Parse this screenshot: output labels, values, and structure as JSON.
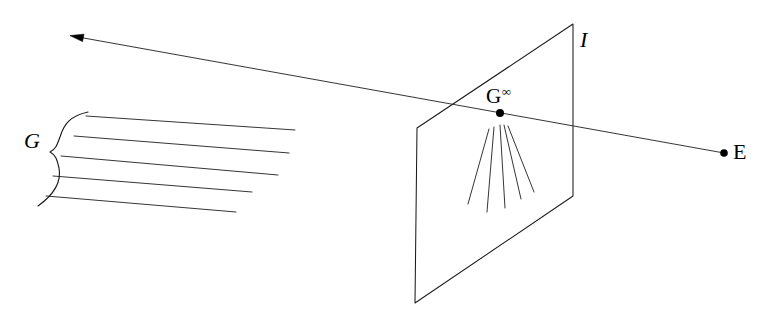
{
  "figure": {
    "background_color": "#ffffff",
    "ink_color": "#1b1b1b",
    "width": 783,
    "height": 322,
    "labels": {
      "pencil_of_lines": {
        "text": "G",
        "style": "italic",
        "x": 24,
        "y": 130,
        "description": "label for the family of parallel lines on the ground plane"
      },
      "image_plane": {
        "text": "I",
        "style": "italic",
        "x": 580,
        "y": 29,
        "description": "label for the image plane"
      },
      "eye_point": {
        "text": "E",
        "style": "roman",
        "x": 733,
        "y": 141,
        "description": "label for the eye / centre of projection"
      },
      "vanishing_point": {
        "base": "G",
        "superscript": "∞",
        "text": "G∞",
        "style": "roman",
        "x": 486,
        "y": 84,
        "description": "vanishing point, G superscript infinity"
      }
    },
    "points": [
      {
        "name": "vanishing-point",
        "label": "G∞",
        "x": 500,
        "y": 113,
        "radius": 4.0
      },
      {
        "name": "eye-point",
        "label": "E",
        "x": 724,
        "y": 153,
        "radius": 3.8
      }
    ],
    "image_plane_quad": {
      "name": "image-plane",
      "corners": [
        {
          "x": 417,
          "y": 128
        },
        {
          "x": 573,
          "y": 24
        },
        {
          "x": 573,
          "y": 196
        },
        {
          "x": 415,
          "y": 303
        }
      ]
    },
    "sight_ray": {
      "name": "ray-through-vanishing-point",
      "from": {
        "x": 724,
        "y": 153
      },
      "through": {
        "x": 500,
        "y": 113
      },
      "to": {
        "x": 72,
        "y": 36
      },
      "arrow_at": "to",
      "description": "line of sight from E through the vanishing point, arrow pointing to the left toward infinity"
    },
    "parallel_lines": {
      "name": "ground-parallel-lines",
      "count": 5,
      "segments": [
        {
          "x1": 86,
          "y1": 116,
          "x2": 295,
          "y2": 130
        },
        {
          "x1": 74,
          "y1": 136,
          "x2": 289,
          "y2": 153
        },
        {
          "x1": 61,
          "y1": 156,
          "x2": 278,
          "y2": 175
        },
        {
          "x1": 53,
          "y1": 176,
          "x2": 252,
          "y2": 192
        },
        {
          "x1": 46,
          "y1": 196,
          "x2": 236,
          "y2": 212
        }
      ]
    },
    "brace": {
      "name": "left-brace",
      "description": "curly brace grouping the parallel lines, opening to the right",
      "tip_x": 54,
      "top_y": 112,
      "bottom_y": 204,
      "mid_y": 152
    },
    "fan_lines": {
      "name": "vanishing-fan",
      "count": 5,
      "apex": {
        "x": 500,
        "y": 113
      },
      "segments": [
        {
          "x1": 489,
          "y1": 129,
          "x2": 468,
          "y2": 204
        },
        {
          "x1": 494,
          "y1": 127,
          "x2": 487,
          "y2": 212
        },
        {
          "x1": 500,
          "y1": 125,
          "x2": 505,
          "y2": 208
        },
        {
          "x1": 504,
          "y1": 125,
          "x2": 521,
          "y2": 199
        },
        {
          "x1": 508,
          "y1": 126,
          "x2": 534,
          "y2": 192
        }
      ]
    }
  }
}
